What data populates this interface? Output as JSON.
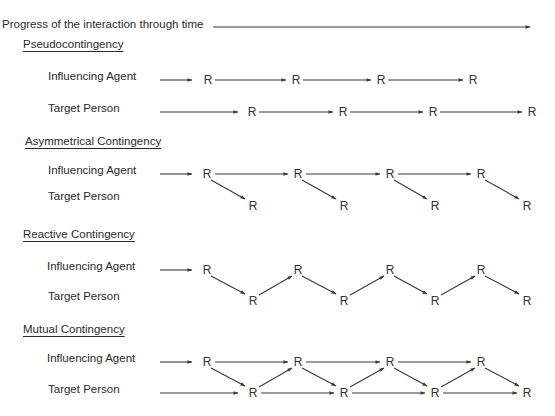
{
  "title": "Progress of the interaction through time",
  "node_label": "R",
  "row_labels": {
    "agent": "Influencing Agent",
    "target": "Target Person"
  },
  "colors": {
    "ink": "#3a3a3a",
    "background": "#ffffff"
  },
  "panels": [
    {
      "heading": "Pseudocontingency",
      "agent_label": "Influencing Agent",
      "target_label": "Target Person",
      "agent_responses": 4,
      "target_responses": 4,
      "links": "agent and target each follow their own independent sequence"
    },
    {
      "heading": "Asymmetrical Contingency",
      "agent_label": "Influencing Agent",
      "target_label": "Target Person",
      "agent_responses": 4,
      "target_responses": 4,
      "links": "agent sequence; each agent response also leads to a target response"
    },
    {
      "heading": "Reactive Contingency",
      "agent_label": "Influencing Agent",
      "target_label": "Target Person",
      "agent_responses": 4,
      "target_responses": 4,
      "links": "alternating: each response leads only to the other person's next response"
    },
    {
      "heading": "Mutual Contingency",
      "agent_label": "Influencing Agent",
      "target_label": "Target Person",
      "agent_responses": 4,
      "target_responses": 4,
      "links": "each response leads to both own next response and other's next response"
    }
  ]
}
